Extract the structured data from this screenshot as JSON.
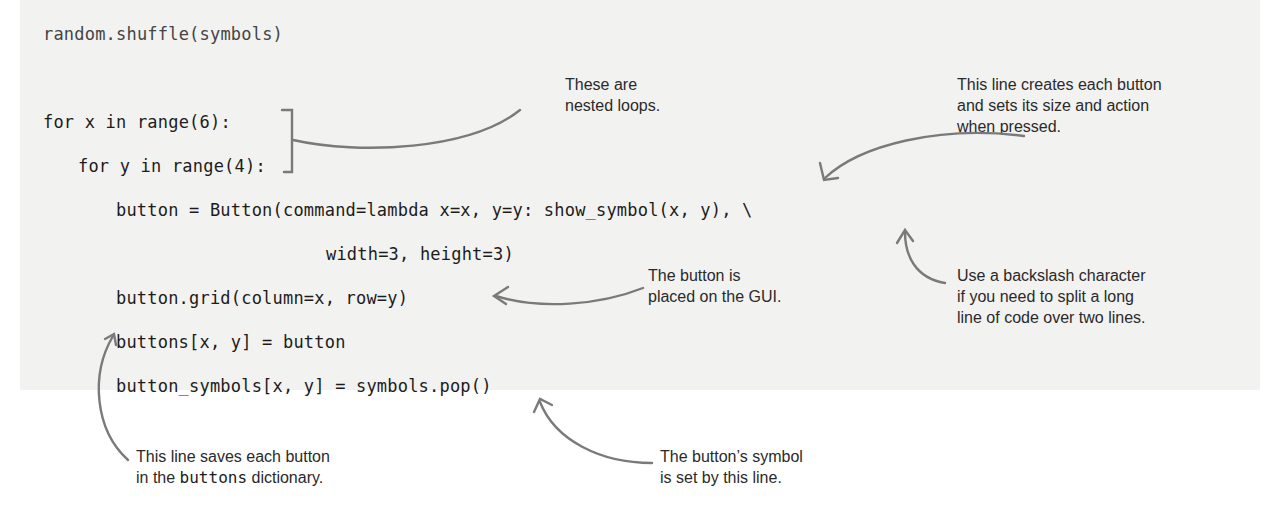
{
  "code": {
    "lines": [
      "random.shuffle(symbols)",
      "for x in range(6):",
      "for y in range(4):",
      "button = Button(command=lambda x=x, y=y: show_symbol(x, y), \\",
      "width=3, height=3)",
      "button.grid(column=x, row=y)",
      "buttons[x, y] = button",
      "button_symbols[x, y] = symbols.pop()"
    ]
  },
  "annotations": {
    "nested_loops": "These are\nnested loops.",
    "creates_button": "This line creates each button\nand sets its size and action\nwhen pressed.",
    "placed_on_gui": "The button is\nplaced on the GUI.",
    "backslash": "Use a backslash character\nif you need to split a long\nline of code over two lines.",
    "saves_button_pre": "This line saves each button\nin the ",
    "saves_button_code": "buttons",
    "saves_button_post": " dictionary.",
    "symbol_set": "The button’s symbol\nis set by this line."
  },
  "colors": {
    "band": "#f2f2f1",
    "arrow": "#7a7a7a",
    "text": "#2a2a2a"
  }
}
